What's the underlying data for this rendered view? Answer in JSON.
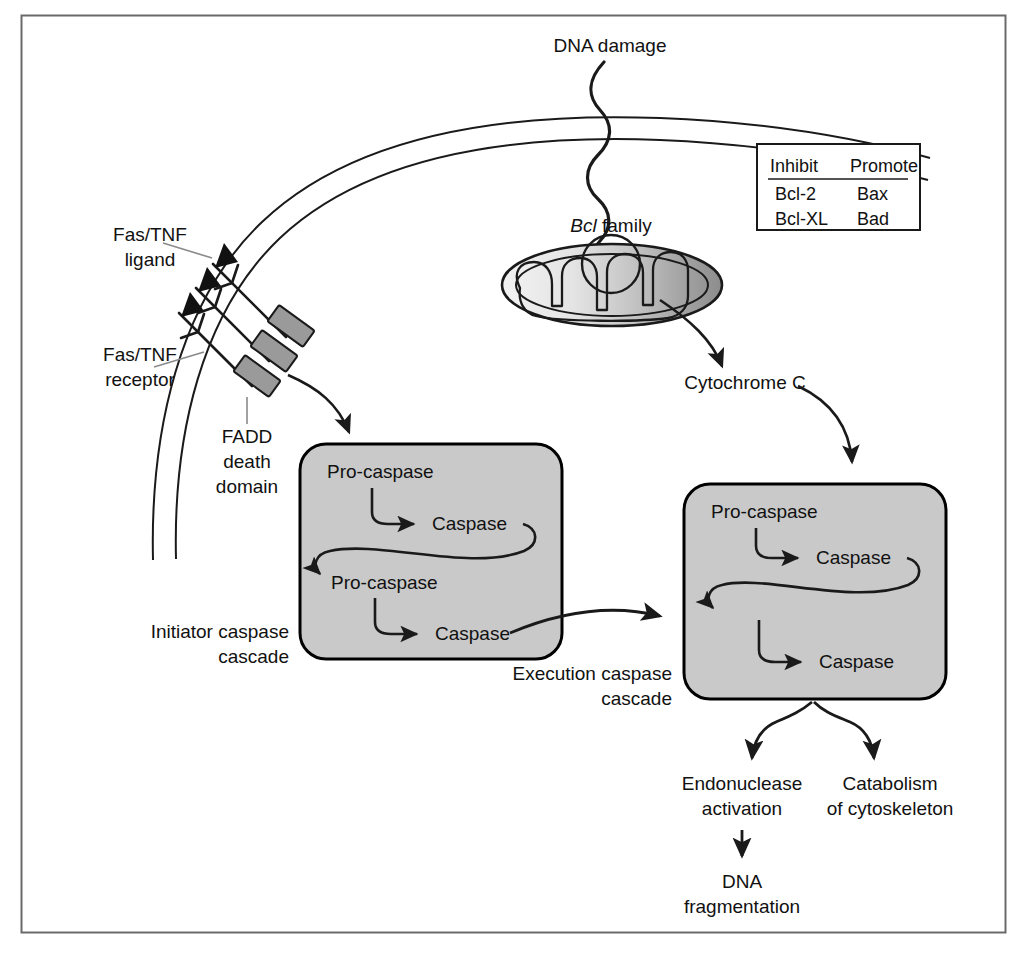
{
  "figure": {
    "title_absent": true,
    "frame": {
      "stroke": "#555555"
    },
    "colors": {
      "box_fill": "#c9c9c9",
      "box_stroke": "#000000",
      "line": "#1a1a1a",
      "receptor_fill": "#9a9a9a",
      "mito_light": "#ededed",
      "mito_mid": "#c4c4c4",
      "mito_dark": "#8e8e8e"
    }
  },
  "labels": {
    "dna_damage": "DNA damage",
    "bcl_family_italic": "Bcl",
    "bcl_family_rest": " family",
    "cytochrome_c": "Cytochrome C",
    "fas_tnf_ligand_l1": "Fas/TNF",
    "fas_tnf_ligand_l2": "ligand",
    "fas_tnf_receptor_l1": "Fas/TNF",
    "fas_tnf_receptor_l2": "receptor",
    "fadd_l1": "FADD",
    "fadd_l2": "death",
    "fadd_l3": "domain",
    "initiator_l1": "Initiator caspase",
    "initiator_l2": "cascade",
    "execution_l1": "Execution caspase",
    "execution_l2": "cascade",
    "endonuclease_l1": "Endonuclease",
    "endonuclease_l2": "activation",
    "dna_frag_l1": "DNA",
    "dna_frag_l2": "fragmentation",
    "catabolism_l1": "Catabolism",
    "catabolism_l2": "of cytoskeleton"
  },
  "bcl_table": {
    "headers": [
      "Inhibit",
      "Promote"
    ],
    "rows": [
      [
        "Bcl-2",
        "Bax"
      ],
      [
        "Bcl-XL",
        "Bad"
      ]
    ]
  },
  "initiator_cascade": {
    "nodes": [
      "Pro-caspase",
      "Caspase",
      "Pro-caspase",
      "Caspase"
    ]
  },
  "execution_cascade": {
    "nodes": [
      "Pro-caspase",
      "Caspase",
      "Caspase"
    ]
  }
}
